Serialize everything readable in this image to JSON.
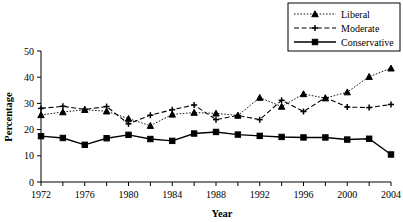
{
  "chart_data": {
    "type": "line",
    "title": "",
    "xlabel": "Year",
    "ylabel": "Percentage",
    "x": [
      1972,
      1974,
      1976,
      1978,
      1980,
      1982,
      1984,
      1986,
      1988,
      1990,
      1992,
      1994,
      1996,
      1998,
      2000,
      2002,
      2004
    ],
    "xlim": [
      1972,
      2004
    ],
    "ylim": [
      0,
      50
    ],
    "yticks": [
      0,
      10,
      20,
      30,
      40,
      50
    ],
    "xticks": [
      1972,
      1974,
      1976,
      1978,
      1980,
      1982,
      1984,
      1986,
      1988,
      1990,
      1992,
      1994,
      1996,
      1998,
      2000,
      2002,
      2004
    ],
    "xticklabels_shown": [
      1972,
      1976,
      1980,
      1984,
      1988,
      1992,
      1996,
      2000,
      2004
    ],
    "grid": false,
    "legend_position": "top-right",
    "series": [
      {
        "name": "Liberal",
        "marker": "triangle",
        "linestyle": "dotted",
        "color": "#000000",
        "values": [
          25.6,
          26.7,
          27.6,
          27.0,
          24.2,
          21.5,
          25.8,
          26.5,
          26.2,
          25.4,
          32.2,
          28.8,
          33.6,
          32.0,
          34.3,
          40.2,
          43.4
        ]
      },
      {
        "name": "Moderate",
        "marker": "plus",
        "linestyle": "dashed",
        "color": "#000000",
        "values": [
          28.1,
          28.9,
          27.7,
          28.8,
          22.2,
          25.5,
          27.6,
          29.4,
          23.8,
          25.4,
          23.8,
          31.2,
          26.9,
          32.2,
          28.6,
          28.4,
          29.6
        ]
      },
      {
        "name": "Conservative",
        "marker": "square",
        "linestyle": "solid",
        "color": "#000000",
        "values": [
          17.5,
          16.8,
          14.2,
          16.7,
          18.0,
          16.4,
          15.7,
          18.5,
          19.1,
          18.1,
          17.6,
          17.2,
          17.0,
          17.0,
          16.2,
          16.5,
          10.5
        ]
      }
    ]
  },
  "legend": {
    "items": [
      {
        "label": "Liberal"
      },
      {
        "label": "Moderate"
      },
      {
        "label": "Conservative"
      }
    ]
  }
}
